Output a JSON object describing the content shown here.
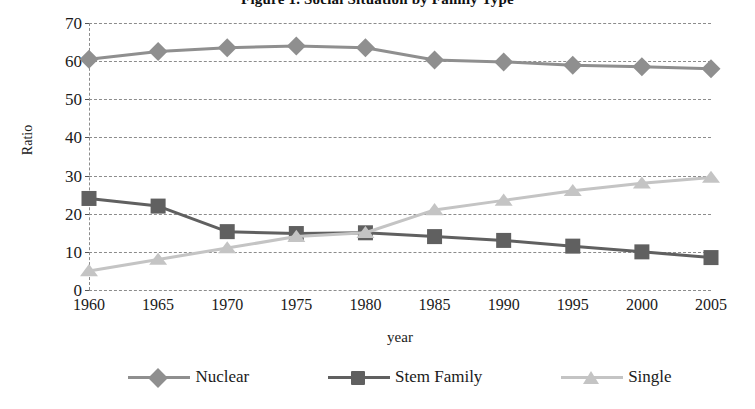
{
  "chart_data": {
    "type": "line",
    "title": "Figure 1. Social Situation by Family Type",
    "xlabel": "year",
    "ylabel": "Ratio",
    "categories": [
      "1960",
      "1965",
      "1970",
      "1975",
      "1980",
      "1985",
      "1990",
      "1995",
      "2000",
      "2005"
    ],
    "x": [
      1960,
      1965,
      1970,
      1975,
      1980,
      1985,
      1990,
      1995,
      2000,
      2005
    ],
    "ylim": [
      0,
      70
    ],
    "yticks": [
      0,
      10,
      20,
      30,
      40,
      50,
      60,
      70
    ],
    "ytick_labels": [
      "0",
      "10",
      "20",
      "30",
      "40",
      "50",
      "60",
      "70"
    ],
    "grid": "horizontal-dashed",
    "legend_position": "bottom",
    "series": [
      {
        "name": "Nuclear",
        "marker": "diamond",
        "color": "#8f8f8f",
        "values": [
          60.5,
          62.5,
          63.5,
          64.0,
          63.5,
          60.3,
          59.8,
          58.9,
          58.5,
          58.0
        ]
      },
      {
        "name": "Stem Family",
        "marker": "square",
        "color": "#606060",
        "values": [
          24.0,
          22.0,
          15.3,
          14.8,
          15.0,
          14.0,
          13.0,
          11.5,
          10.0,
          8.5
        ]
      },
      {
        "name": "Single",
        "marker": "triangle",
        "color": "#c4c4c4",
        "values": [
          5.0,
          8.0,
          11.0,
          14.0,
          15.0,
          21.0,
          23.5,
          26.0,
          28.0,
          29.5
        ]
      }
    ]
  },
  "legend": {
    "items": [
      {
        "label": "Nuclear"
      },
      {
        "label": "Stem Family"
      },
      {
        "label": "Single"
      }
    ]
  },
  "colors": {
    "nuclear": "#8f8f8f",
    "stem_family": "#606060",
    "single": "#c4c4c4",
    "grid": "#8c8c8c",
    "text": "#1a1a1a",
    "background": "#ffffff"
  }
}
